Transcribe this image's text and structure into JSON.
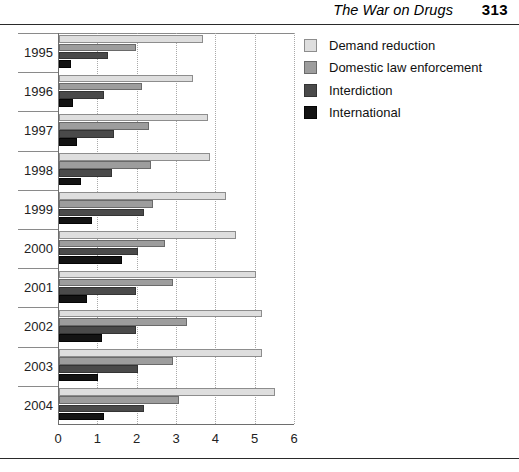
{
  "header": {
    "title": "The War on Drugs",
    "page_number": "313"
  },
  "chart_data": {
    "type": "bar",
    "orientation": "horizontal",
    "title": "",
    "xlabel": "",
    "ylabel": "",
    "xlim": [
      0,
      6
    ],
    "xticks": [
      "0",
      "1",
      "2",
      "3",
      "4",
      "5",
      "6"
    ],
    "grid": "vertical-dotted",
    "legend_position": "right",
    "categories": [
      "1995",
      "1996",
      "1997",
      "1998",
      "1999",
      "2000",
      "2001",
      "2002",
      "2003",
      "2004"
    ],
    "series": [
      {
        "name": "Demand reduction",
        "color": "#dedede",
        "values": [
          3.65,
          3.4,
          3.8,
          3.85,
          4.25,
          4.5,
          5.0,
          5.15,
          5.15,
          5.5
        ]
      },
      {
        "name": "Domestic law enforcement",
        "color": "#9d9d9d",
        "values": [
          1.95,
          2.1,
          2.3,
          2.35,
          2.4,
          2.7,
          2.9,
          3.25,
          2.9,
          3.05
        ]
      },
      {
        "name": "Interdiction",
        "color": "#4a4a4a",
        "values": [
          1.25,
          1.15,
          1.4,
          1.35,
          2.15,
          2.0,
          1.95,
          1.95,
          2.0,
          2.15
        ]
      },
      {
        "name": "International",
        "color": "#131313",
        "values": [
          0.3,
          0.35,
          0.45,
          0.55,
          0.85,
          1.6,
          0.7,
          1.1,
          1.0,
          1.15
        ]
      }
    ]
  }
}
